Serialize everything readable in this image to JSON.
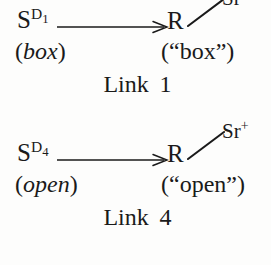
{
  "figure": {
    "type": "reaction-scheme-diagram",
    "background_color": "#fdfdfc",
    "ink_color": "#1a1a1a",
    "schemes": [
      {
        "id": "link-1",
        "reactant": {
          "symbol": "S",
          "superscript_letter": "D",
          "superscript_subscript": "1",
          "state_label": "(",
          "state_word": "box",
          "state_label_close": ")"
        },
        "arrow": "right-arrow",
        "product": {
          "core": "R",
          "bond": "single-bond",
          "substituent": "Sr",
          "substituent_charge": "+",
          "state_label_open": "(“",
          "state_word": "box",
          "state_label_close": "”)"
        },
        "caption_label": "Link",
        "caption_number": "1"
      },
      {
        "id": "link-4",
        "reactant": {
          "symbol": "S",
          "superscript_letter": "D",
          "superscript_subscript": "4",
          "state_label": "(",
          "state_word": "open",
          "state_label_close": ")"
        },
        "arrow": "right-arrow",
        "product": {
          "core": "R",
          "bond": "single-bond",
          "substituent": "Sr",
          "substituent_charge": "+",
          "state_label_open": "(“",
          "state_word": "open",
          "state_label_close": "”)"
        },
        "caption_label": "Link",
        "caption_number": "4"
      }
    ]
  }
}
